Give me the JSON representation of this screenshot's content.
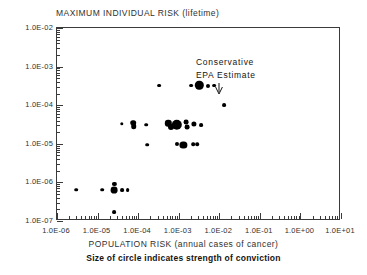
{
  "chart_data": {
    "type": "scatter",
    "title": "MAXIMUM INDIVIDUAL RISK (lifetime)",
    "xlabel": "POPULATION RISK (annual cases of cancer)",
    "ylabel": "MAXIMUM INDIVIDUAL RISK (lifetime)",
    "caption": "Size of circle indicates strength of conviction",
    "xscale": "log",
    "yscale": "log",
    "xlim": [
      1e-06,
      10.0
    ],
    "ylim": [
      1e-07,
      0.01
    ],
    "grid": false,
    "legend": null,
    "size_encoding": "Size of circle indicates strength of conviction",
    "xticklabels": [
      "1.0E-06",
      "1.0E-05",
      "1.0E-04",
      "1.0E-03",
      "1.0E-02",
      "1.0E-01",
      "1.0E+00",
      "1.0E+01"
    ],
    "xtickvalues": [
      1e-06,
      1e-05,
      0.0001,
      0.001,
      0.01,
      0.1,
      1,
      10
    ],
    "yticklabels": [
      "1.0E-02",
      "1.0E-03",
      "1.0E-04",
      "1.0E-05",
      "1.0E-06",
      "1.0E-07"
    ],
    "ytickvalues": [
      0.01,
      0.001,
      0.0001,
      1e-05,
      1e-06,
      1e-07
    ],
    "annotations": [
      {
        "text": "Conservative",
        "x": 0.003,
        "y": 0.0013
      },
      {
        "text": "EPA Estimate",
        "x": 0.003,
        "y": 0.00065
      },
      {
        "text": "arrow-to-point",
        "x": 0.0032,
        "y": 0.00034
      }
    ],
    "points": [
      {
        "x": 0.00033,
        "y": 0.00032,
        "r": 1.9
      },
      {
        "x": 0.002,
        "y": 0.00032,
        "r": 1.9
      },
      {
        "x": 0.0032,
        "y": 0.00033,
        "r": 4.2
      },
      {
        "x": 0.0052,
        "y": 0.00032,
        "r": 2.0
      },
      {
        "x": 0.0075,
        "y": 0.00032,
        "r": 1.9
      },
      {
        "x": 0.013,
        "y": 0.0001,
        "r": 1.9
      },
      {
        "x": 4e-05,
        "y": 3.3e-05,
        "r": 1.7
      },
      {
        "x": 7.5e-05,
        "y": 3.5e-05,
        "r": 2.8
      },
      {
        "x": 7.8e-05,
        "y": 2.9e-05,
        "r": 2.8
      },
      {
        "x": 0.00016,
        "y": 3.1e-05,
        "r": 1.8
      },
      {
        "x": 0.00055,
        "y": 3.4e-05,
        "r": 3.2
      },
      {
        "x": 0.00065,
        "y": 2.8e-05,
        "r": 3.0
      },
      {
        "x": 0.0009,
        "y": 3.1e-05,
        "r": 5.2
      },
      {
        "x": 0.0015,
        "y": 3.6e-05,
        "r": 2.4
      },
      {
        "x": 0.0016,
        "y": 2.7e-05,
        "r": 2.4
      },
      {
        "x": 0.0024,
        "y": 3.2e-05,
        "r": 2.6
      },
      {
        "x": 0.0036,
        "y": 3e-05,
        "r": 1.9
      },
      {
        "x": 0.00017,
        "y": 9.5e-06,
        "r": 1.8
      },
      {
        "x": 0.0009,
        "y": 9.8e-06,
        "r": 2.0
      },
      {
        "x": 0.0013,
        "y": 9.5e-06,
        "r": 3.6
      },
      {
        "x": 0.0023,
        "y": 9.6e-06,
        "r": 1.8
      },
      {
        "x": 0.0029,
        "y": 9.6e-06,
        "r": 1.8
      },
      {
        "x": 3e-06,
        "y": 6.5e-07,
        "r": 1.8
      },
      {
        "x": 1.3e-05,
        "y": 6.5e-07,
        "r": 1.8
      },
      {
        "x": 2.6e-05,
        "y": 9e-07,
        "r": 2.1
      },
      {
        "x": 2.6e-05,
        "y": 6.2e-07,
        "r": 3.4
      },
      {
        "x": 4e-05,
        "y": 6.4e-07,
        "r": 1.9
      },
      {
        "x": 5.5e-05,
        "y": 6.4e-07,
        "r": 1.9
      },
      {
        "x": 2.6e-05,
        "y": 1.7e-07,
        "r": 1.9
      }
    ]
  }
}
